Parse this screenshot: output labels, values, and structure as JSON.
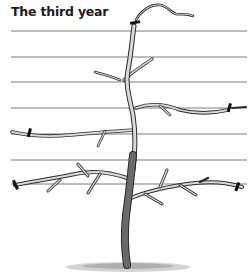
{
  "figure": {
    "title": "The third year",
    "wires": [
      31,
      57,
      82,
      108,
      134,
      160,
      184
    ],
    "colors": {
      "wire": "#6e6e6e",
      "branch_fill": "#d9d9d9",
      "branch_outline": "#2b2b2b",
      "trunk_fill": "#6a6a6a",
      "tie": "#111111",
      "ground": "#8a8a8a"
    }
  }
}
